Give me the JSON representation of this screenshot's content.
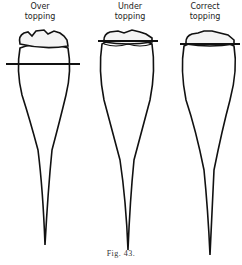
{
  "figure": {
    "caption": "Fig. 43.",
    "items": [
      {
        "label_line1": "Over",
        "label_line2": "topping"
      },
      {
        "label_line1": "Under",
        "label_line2": "topping"
      },
      {
        "label_line1": "Correct",
        "label_line2": "topping"
      }
    ]
  }
}
